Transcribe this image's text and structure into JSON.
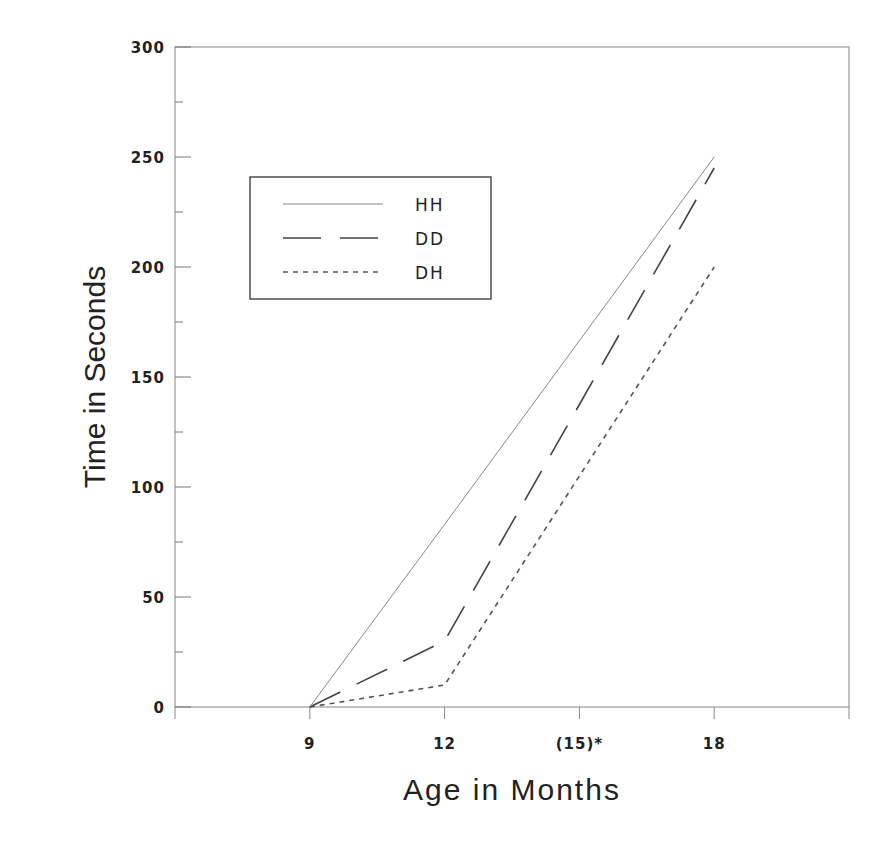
{
  "chart_data": {
    "type": "line",
    "title": "",
    "xlabel": "Age in Months",
    "ylabel": "Time in Seconds",
    "x": [
      9,
      12,
      18
    ],
    "x_ticks": [
      {
        "value": 9,
        "label": "9"
      },
      {
        "value": 12,
        "label": "12"
      },
      {
        "value": 15,
        "label": "(15)*"
      },
      {
        "value": 18,
        "label": "18"
      }
    ],
    "xlim": [
      6,
      21
    ],
    "ylim": [
      0,
      300
    ],
    "y_ticks": [
      0,
      50,
      100,
      150,
      200,
      250,
      300
    ],
    "y_minor_step": 25,
    "grid": false,
    "legend_position": "upper left (inside plot)",
    "series": [
      {
        "name": "HH",
        "style": "solid",
        "color": "#888888",
        "points": [
          {
            "x": 9,
            "y": 0
          },
          {
            "x": 12,
            "y": 83
          },
          {
            "x": 18,
            "y": 250
          }
        ]
      },
      {
        "name": "DD",
        "style": "long-dash",
        "color": "#444444",
        "points": [
          {
            "x": 9,
            "y": 0
          },
          {
            "x": 12,
            "y": 30
          },
          {
            "x": 18,
            "y": 245
          }
        ]
      },
      {
        "name": "DH",
        "style": "short-dash",
        "color": "#555555",
        "points": [
          {
            "x": 9,
            "y": 0
          },
          {
            "x": 12,
            "y": 10
          },
          {
            "x": 18,
            "y": 200
          }
        ]
      }
    ]
  },
  "labels": {
    "xlabel": "Age in Months",
    "ylabel": "Time in Seconds",
    "legend": [
      "HH",
      "DD",
      "DH"
    ],
    "x_ticks": [
      "9",
      "12",
      "(15)*",
      "18"
    ],
    "y_ticks": [
      "0",
      "50",
      "100",
      "150",
      "200",
      "250",
      "300"
    ]
  }
}
